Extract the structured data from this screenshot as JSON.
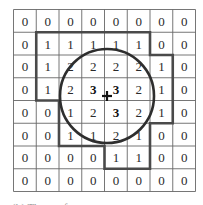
{
  "grid": {
    "rows": 8,
    "cols": 8,
    "values": [
      [
        0,
        0,
        0,
        0,
        0,
        0,
        0,
        0
      ],
      [
        0,
        1,
        1,
        1,
        1,
        1,
        0,
        0
      ],
      [
        0,
        1,
        2,
        2,
        2,
        2,
        1,
        0
      ],
      [
        0,
        1,
        2,
        3,
        3,
        2,
        1,
        0
      ],
      [
        0,
        0,
        1,
        2,
        3,
        2,
        1,
        0
      ],
      [
        0,
        0,
        1,
        1,
        2,
        1,
        0,
        0
      ],
      [
        0,
        0,
        0,
        0,
        1,
        1,
        0,
        0
      ],
      [
        0,
        0,
        0,
        0,
        0,
        0,
        0,
        0
      ]
    ],
    "bold_cells": [
      [
        3,
        3
      ],
      [
        3,
        4
      ],
      [
        4,
        4
      ]
    ],
    "line_color": "#555555",
    "outline_color": "#555555"
  },
  "outline_polygon": [
    [
      1,
      1
    ],
    [
      6,
      1
    ],
    [
      6,
      2
    ],
    [
      7,
      2
    ],
    [
      7,
      5
    ],
    [
      6,
      5
    ],
    [
      6,
      7
    ],
    [
      4,
      7
    ],
    [
      4,
      6
    ],
    [
      2,
      6
    ],
    [
      2,
      4
    ],
    [
      1,
      4
    ],
    [
      1,
      1
    ]
  ],
  "circle": {
    "center_marker": "+",
    "color": "#333333"
  },
  "caption": {
    "text": "(b) The ... of ..."
  }
}
